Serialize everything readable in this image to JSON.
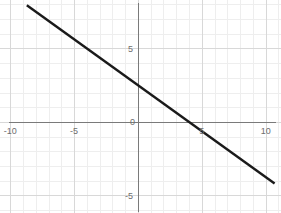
{
  "figure": {
    "title": "",
    "width": 281,
    "height": 213,
    "background_color": "#ffffff"
  },
  "style": {
    "minor_grid_color": "#eeeeee",
    "major_grid_color": "#d8d8d8",
    "axis_color": "#7a7a7a",
    "line_color": "#1a1a1a",
    "tick_label_color": "#6e6e6e"
  },
  "chart_data": {
    "type": "line",
    "title": "",
    "xlabel": "",
    "ylabel": "",
    "xlim": [
      -10.8,
      11.2
    ],
    "ylim": [
      -6.2,
      8.3
    ],
    "grid": true,
    "minor_grid_step": 1,
    "major_grid_step": 5,
    "legend": "none",
    "x_ticks": [
      -10,
      -5,
      0,
      5,
      10
    ],
    "x_tick_labels": [
      "-10",
      "-5",
      "0",
      "5",
      "10"
    ],
    "y_ticks": [
      5,
      0,
      -5
    ],
    "y_tick_labels": [
      "5",
      "0",
      "-5"
    ],
    "origin_label": "0",
    "series": [
      {
        "name": "line",
        "equation": "y = -0.625x + 2.5",
        "slope": -0.625,
        "intercept": 2.5,
        "x_intercept": 4,
        "y_intercept": 2.5,
        "x": [
          -8.7,
          10.7
        ],
        "y": [
          7.94,
          -4.19
        ],
        "color": "#1a1a1a",
        "width": 2.4
      }
    ]
  }
}
